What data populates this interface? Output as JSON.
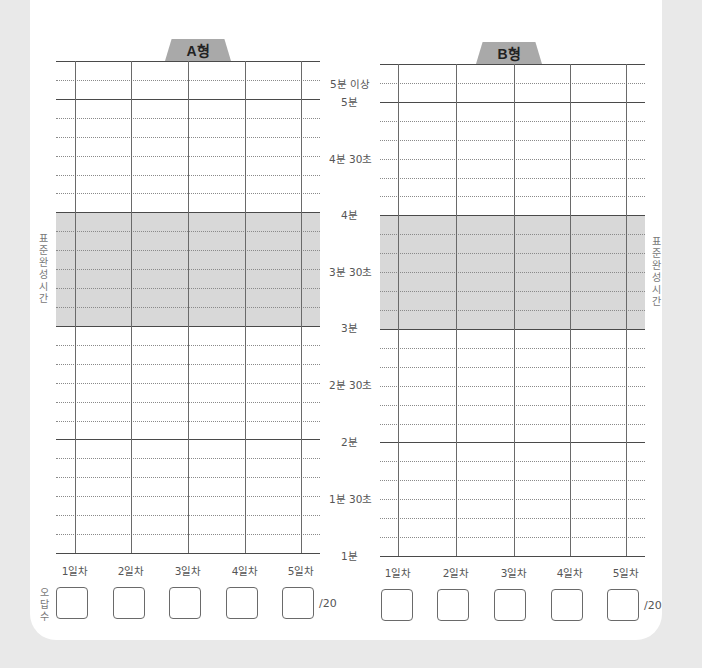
{
  "charts": [
    {
      "tab_label": "A형"
    },
    {
      "tab_label": "B형"
    }
  ],
  "y_axis_labels": {
    "over5": "5분 이상",
    "m5": "5분",
    "m4s30": "4분 30초",
    "m4": "4분",
    "m3s30": "3분 30초",
    "m3": "3분",
    "m2s30": "2분 30초",
    "m2": "2분",
    "m1s30": "1분 30초",
    "m1": "1분"
  },
  "standard_time_label": "표준완성시간",
  "x_axis_labels": [
    "1일차",
    "2일차",
    "3일차",
    "4일차",
    "5일차"
  ],
  "wrong_answers_label": "오답수",
  "wrong_answers_total": "/20",
  "colors": {
    "shade": "#d8d8d8",
    "tab": "#a9a9a9",
    "background": "#e9e9e9"
  }
}
